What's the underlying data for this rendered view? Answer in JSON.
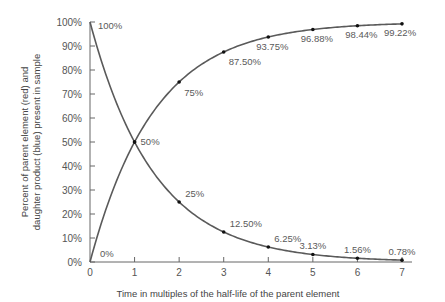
{
  "chart_data": {
    "type": "line",
    "title": "",
    "xlabel": "Time in multiples of the half-life of the parent element",
    "ylabel_lines": [
      "Percent of parent element (red) and",
      "daughter product (blue) present in sample"
    ],
    "ylabel": "Percent of parent element (red) and daughter product (blue) present in sample",
    "x": [
      0,
      1,
      2,
      3,
      4,
      5,
      6,
      7
    ],
    "xlim": [
      0,
      7
    ],
    "ylim": [
      0,
      100
    ],
    "x_ticks": [
      "0",
      "1",
      "2",
      "3",
      "4",
      "5",
      "6",
      "7"
    ],
    "y_ticks": [
      "0%",
      "10%",
      "20%",
      "30%",
      "40%",
      "50%",
      "60%",
      "70%",
      "80%",
      "90%",
      "100%"
    ],
    "grid": false,
    "legend": null,
    "series": [
      {
        "name": "Parent element (red)",
        "values": [
          100,
          50,
          25,
          12.5,
          6.25,
          3.13,
          1.56,
          0.78
        ],
        "labels": [
          "100%",
          "50%",
          "25%",
          "12.50%",
          "6.25%",
          "3.13%",
          "1.56%",
          "0.78%"
        ]
      },
      {
        "name": "Daughter product (blue)",
        "values": [
          0,
          50,
          75,
          87.5,
          93.75,
          96.88,
          98.44,
          99.22
        ],
        "labels": [
          "0%",
          "",
          "75%",
          "87.50%",
          "93.75%",
          "96.88%",
          "98.44%",
          "99.22%"
        ]
      }
    ],
    "colors": {
      "line": "#5a5a5a",
      "marker": "#111111",
      "axis": "#666666",
      "text": "#555555"
    }
  }
}
